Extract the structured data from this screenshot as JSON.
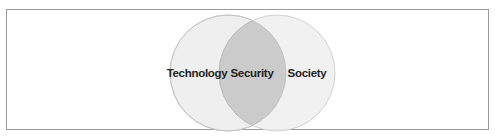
{
  "diagram": {
    "type": "venn",
    "sets": [
      {
        "label": "Technology",
        "color": "#ececec"
      },
      {
        "label": "Society",
        "color": "#ececec"
      }
    ],
    "intersection": {
      "label": "Security",
      "color": "#c9c9c9"
    },
    "stroke_color": "#d0d0d0",
    "frame_color": "#9a9a9a"
  }
}
